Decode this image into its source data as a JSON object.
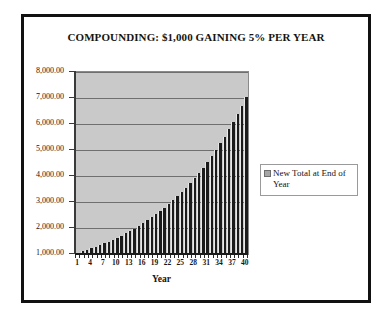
{
  "figure": {
    "border_color": "#111111",
    "background": "#ffffff"
  },
  "chart_data": {
    "type": "bar",
    "title": "COMPOUNDING: $1,000 GAINING 5% PER YEAR",
    "xlabel": "Year",
    "ylabel": "",
    "ylim": [
      1000,
      8000
    ],
    "ytick_values": [
      1000,
      2000,
      3000,
      4000,
      5000,
      6000,
      7000,
      8000
    ],
    "ytick_labels": [
      "1,000.00",
      "2,000.00",
      "3,000.00",
      "4,000.00",
      "5,000.00",
      "6,000.00",
      "7,000.00",
      "8,000.00"
    ],
    "xtick_labels": [
      "1",
      "4",
      "7",
      "10",
      "13",
      "16",
      "19",
      "22",
      "25",
      "28",
      "31",
      "34",
      "37",
      "40"
    ],
    "xtick_step": 3,
    "grid": true,
    "grid_axis": "y",
    "plot_background": "#c9c9c9",
    "bar_color": "#1b1b1b",
    "legend": {
      "position": "right",
      "entries": [
        {
          "label": "New Total at End of Year",
          "color": "#a6a6a6"
        }
      ]
    },
    "categories": [
      1,
      2,
      3,
      4,
      5,
      6,
      7,
      8,
      9,
      10,
      11,
      12,
      13,
      14,
      15,
      16,
      17,
      18,
      19,
      20,
      21,
      22,
      23,
      24,
      25,
      26,
      27,
      28,
      29,
      30,
      31,
      32,
      33,
      34,
      35,
      36,
      37,
      38,
      39,
      40
    ],
    "series": [
      {
        "name": "New Total at End of Year",
        "values": [
          1050.0,
          1102.5,
          1157.63,
          1215.51,
          1276.28,
          1340.1,
          1407.1,
          1477.46,
          1551.33,
          1628.89,
          1710.34,
          1795.86,
          1885.65,
          1979.93,
          2078.93,
          2182.87,
          2292.02,
          2406.62,
          2526.95,
          2653.3,
          2785.96,
          2925.26,
          3071.52,
          3225.1,
          3386.35,
          3555.67,
          3733.46,
          3920.13,
          4116.14,
          4321.94,
          4538.04,
          4764.94,
          5003.19,
          5253.35,
          5516.02,
          5791.82,
          6081.41,
          6385.48,
          6704.75,
          7039.99
        ]
      }
    ]
  }
}
